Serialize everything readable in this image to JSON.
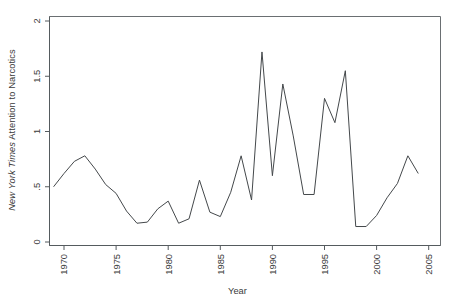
{
  "chart_data": {
    "type": "line",
    "title": "",
    "xlabel": "Year",
    "ylabel_plain": "New York Times Attention to Narcotics",
    "ylabel_italic_part": "New York Times",
    "ylabel_rest_part": " Attention to Narcotics",
    "xlim": [
      1968.5,
      2005.5
    ],
    "ylim": [
      0,
      2
    ],
    "grid": false,
    "legend": "none",
    "xticks": [
      "1970",
      "1975",
      "1980",
      "1985",
      "1990",
      "1995",
      "2000",
      "2005"
    ],
    "xtick_values": [
      1970,
      1975,
      1980,
      1985,
      1990,
      1995,
      2000,
      2005
    ],
    "yticks": [
      "0",
      ".5",
      "1",
      "1.5",
      "2"
    ],
    "ytick_values": [
      0,
      0.5,
      1,
      1.5,
      2
    ],
    "x": [
      1969,
      1970,
      1971,
      1972,
      1973,
      1974,
      1975,
      1976,
      1977,
      1978,
      1979,
      1980,
      1981,
      1982,
      1983,
      1984,
      1985,
      1986,
      1987,
      1988,
      1989,
      1990,
      1991,
      1992,
      1993,
      1994,
      1995,
      1996,
      1997,
      1998,
      1999,
      2000,
      2001,
      2002,
      2003,
      2004
    ],
    "values": [
      0.5,
      0.62,
      0.73,
      0.78,
      0.66,
      0.52,
      0.44,
      0.28,
      0.17,
      0.18,
      0.3,
      0.37,
      0.17,
      0.21,
      0.56,
      0.27,
      0.23,
      0.45,
      0.78,
      0.38,
      1.72,
      0.6,
      1.43,
      0.96,
      0.43,
      0.43,
      1.3,
      1.08,
      1.55,
      0.14,
      0.14,
      0.24,
      0.4,
      0.53,
      0.78,
      0.62
    ],
    "series": [
      {
        "name": "New York Times Attention to Narcotics",
        "values": [
          0.5,
          0.62,
          0.73,
          0.78,
          0.66,
          0.52,
          0.44,
          0.28,
          0.17,
          0.18,
          0.3,
          0.37,
          0.17,
          0.21,
          0.56,
          0.27,
          0.23,
          0.45,
          0.78,
          0.38,
          1.72,
          0.6,
          1.43,
          0.96,
          0.43,
          0.43,
          1.3,
          1.08,
          1.55,
          0.14,
          0.14,
          0.24,
          0.4,
          0.53,
          0.78,
          0.62
        ],
        "color": "#44484b"
      }
    ]
  },
  "axes": {
    "x_axis_title": "Year",
    "y_axis_title_italic": "New York Times",
    "y_axis_title_rest": " Attention to Narcotics"
  }
}
